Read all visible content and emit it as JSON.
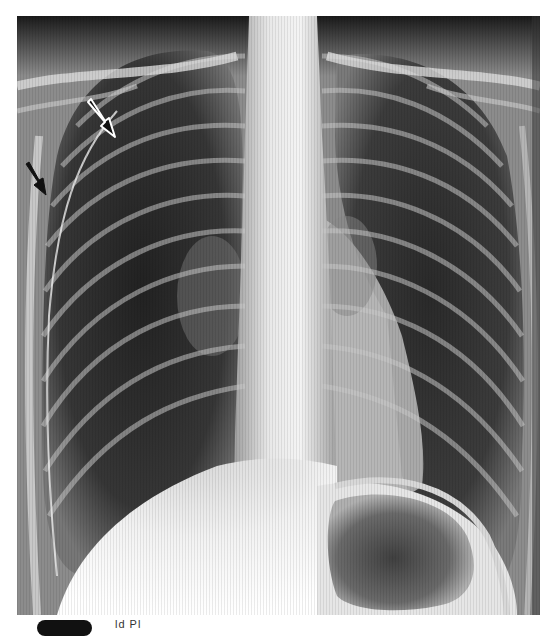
{
  "figure": {
    "type": "chest-radiograph",
    "view": "frontal",
    "annotations": [
      {
        "name": "arrow-upper",
        "style": "black-with-white-outline",
        "from": [
          87,
          103
        ],
        "to": [
          115,
          137
        ]
      },
      {
        "name": "arrow-lower",
        "style": "black",
        "from": [
          25,
          162
        ],
        "to": [
          46,
          195
        ]
      }
    ]
  },
  "caption": {
    "icon": "pill-badge-icon",
    "text": "ld  Pl"
  }
}
